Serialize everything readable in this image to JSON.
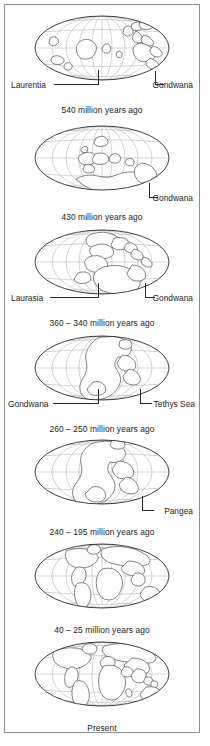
{
  "figure": {
    "kind": "continental-drift-time-series",
    "projection": "Mollweide (oval equal-area) world map",
    "panel_count": 7,
    "frame_color": "#8e8e8e",
    "land_outline_color": "#3a3a3a",
    "graticule_color": "#a9a9a9",
    "limb_color": "#2b2b2b",
    "background_color": "#ffffff",
    "text_color": "#1b1b1b"
  },
  "panels": [
    {
      "id": "panel-540",
      "caption": "540 million years ago",
      "labels": [
        {
          "text": "Laurentia",
          "side": "left"
        },
        {
          "text": "Gondwana",
          "side": "right"
        }
      ]
    },
    {
      "id": "panel-430",
      "caption": "430 million years ago",
      "labels": [
        {
          "text": "Gondwana",
          "side": "right"
        }
      ]
    },
    {
      "id": "panel-360-340",
      "caption": "360 – 340 million years ago",
      "labels": [
        {
          "text": "Laurasia",
          "side": "left"
        },
        {
          "text": "Gondwana",
          "side": "right"
        }
      ]
    },
    {
      "id": "panel-260-250",
      "caption": "260 – 250 million years ago",
      "labels": [
        {
          "text": "Gondwana",
          "side": "left"
        },
        {
          "text": "Tethys Sea",
          "side": "right"
        }
      ]
    },
    {
      "id": "panel-240-195",
      "caption": "240 – 195 million years ago",
      "labels": [
        {
          "text": "Pangea",
          "side": "right"
        }
      ]
    },
    {
      "id": "panel-40-25",
      "caption": "40 – 25 million years ago",
      "labels": []
    },
    {
      "id": "panel-present",
      "caption": "Present",
      "labels": []
    }
  ]
}
